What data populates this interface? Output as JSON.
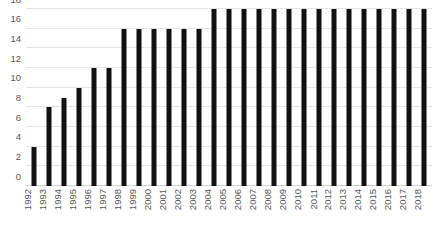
{
  "chart_data": {
    "type": "bar",
    "title": "",
    "subtitle": "",
    "xlabel": "",
    "ylabel": "",
    "ylim": [
      0,
      18
    ],
    "y_ticks": [
      0,
      2,
      4,
      6,
      8,
      10,
      12,
      14,
      16,
      18
    ],
    "grid": "horizontal",
    "legend": "none",
    "bar_color": "#111111",
    "gridline_color": "#e4e4e4",
    "tick_label_color": "#555555",
    "x_label_rotation": -90,
    "categories": [
      "1992",
      "1993",
      "1994",
      "1995",
      "1996",
      "1997",
      "1998",
      "1999",
      "2000",
      "2001",
      "2002",
      "2003",
      "2004",
      "2005",
      "2006",
      "2007",
      "2008",
      "2009",
      "2010",
      "2011",
      "2012",
      "2013",
      "2014",
      "2015",
      "2016",
      "2017",
      "2018"
    ],
    "values": [
      4,
      8,
      9,
      10,
      12,
      12,
      16,
      16,
      16,
      16,
      16,
      16,
      18,
      18,
      18,
      18,
      18,
      18,
      18,
      18,
      18,
      18,
      18,
      18,
      18,
      18,
      18
    ]
  }
}
